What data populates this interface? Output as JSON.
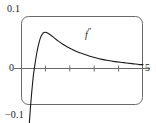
{
  "figure": {
    "name": "second-derivative-plot",
    "frame": {
      "x0": 21,
      "y0": 16,
      "x1": 143,
      "y1": 105,
      "corner_radius": 7,
      "stroke_color": "#555555"
    },
    "axis_color": "#555555",
    "curve_color": "#1a1a1a",
    "background": "#ffffff"
  },
  "labels": {
    "y_top": "0.1",
    "y_zero": "0",
    "y_bottom": "−0.1",
    "x_right": "5",
    "curve_base": "f",
    "curve_prime": "″"
  },
  "chart_data": {
    "type": "line",
    "title": "",
    "subtitle": "",
    "xlabel": "",
    "ylabel": "",
    "xlim": [
      0,
      5
    ],
    "ylim": [
      -0.1,
      0.1
    ],
    "grid": false,
    "legend": "none",
    "annotations": [
      {
        "text": "f″",
        "x": 2.6,
        "y": 0.055,
        "note": "curve label placed above the decaying branch"
      }
    ],
    "x_ticks": [
      1,
      2,
      3,
      4
    ],
    "x_tick_labels": [
      "",
      "",
      "",
      ""
    ],
    "y_ticks": [
      -0.1,
      0,
      0.1
    ],
    "y_tick_labels": [
      "−0.1",
      "0",
      "0.1"
    ],
    "axis_line_y": 0,
    "series": [
      {
        "name": "f″",
        "x": [
          0.3,
          0.33,
          0.36,
          0.4,
          0.44,
          0.48,
          0.52,
          0.57,
          0.62,
          0.68,
          0.74,
          0.8,
          0.86,
          0.92,
          1.0,
          1.1,
          1.2,
          1.35,
          1.5,
          1.7,
          1.9,
          2.1,
          2.35,
          2.6,
          2.9,
          3.2,
          3.5,
          3.85,
          4.2,
          4.55,
          4.85,
          5.0
        ],
        "y": [
          -0.14,
          -0.12,
          -0.098,
          -0.072,
          -0.048,
          -0.027,
          -0.009,
          0.008,
          0.024,
          0.04,
          0.053,
          0.063,
          0.069,
          0.073,
          0.074,
          0.072,
          0.069,
          0.063,
          0.057,
          0.05,
          0.044,
          0.039,
          0.033,
          0.029,
          0.024,
          0.02,
          0.017,
          0.014,
          0.012,
          0.01,
          0.008,
          0.008
        ]
      }
    ]
  }
}
